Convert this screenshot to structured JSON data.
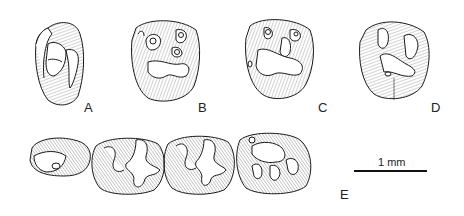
{
  "figure": {
    "panels": [
      {
        "id": "A",
        "label": "A"
      },
      {
        "id": "B",
        "label": "B"
      },
      {
        "id": "C",
        "label": "C"
      },
      {
        "id": "D",
        "label": "D"
      },
      {
        "id": "E",
        "label": "E"
      }
    ],
    "scale_bar": {
      "label": "1 mm"
    },
    "colors": {
      "ink": "#1a1a1a",
      "hatch": "#555555",
      "background": "#ffffff"
    }
  }
}
